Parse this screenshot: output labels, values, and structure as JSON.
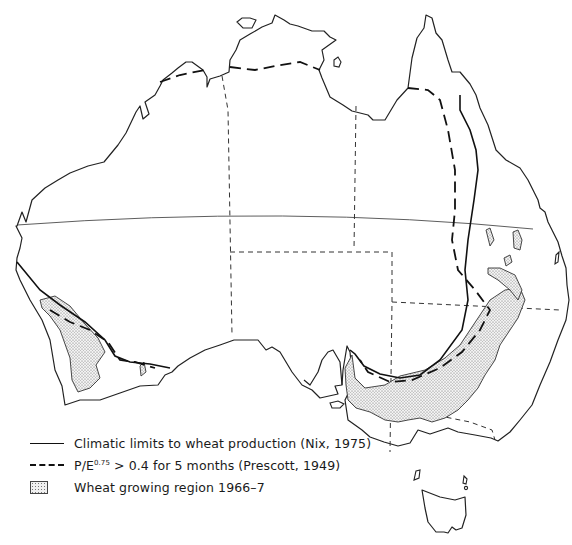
{
  "map": {
    "title": "Wheat growing region and climatic limits in Australia",
    "region": "Australia"
  },
  "legend": {
    "items": [
      {
        "key": "nix",
        "symbol": "solid-line",
        "label": "Climatic limits to wheat production (Nix, 1975)"
      },
      {
        "key": "prescott",
        "symbol": "dashed-line",
        "label_prefix": "P/E",
        "label_superscript": "0.75",
        "label_suffix": " > 0.4 for 5 months (Prescott, 1949)"
      },
      {
        "key": "wheat",
        "symbol": "stippled-area",
        "label": "Wheat growing region 1966–7"
      }
    ]
  },
  "colors": {
    "line": "#111111",
    "background": "#ffffff",
    "stipple": "#777777"
  }
}
